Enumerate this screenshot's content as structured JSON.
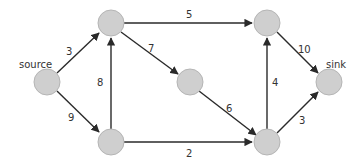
{
  "diagram": {
    "type": "flow-network",
    "nodes": [
      {
        "id": "source",
        "label": "source",
        "x": 47,
        "y": 82
      },
      {
        "id": "a",
        "label": "",
        "x": 111,
        "y": 23
      },
      {
        "id": "b",
        "label": "",
        "x": 111,
        "y": 142
      },
      {
        "id": "c",
        "label": "",
        "x": 190,
        "y": 82
      },
      {
        "id": "d",
        "label": "",
        "x": 267,
        "y": 23
      },
      {
        "id": "e",
        "label": "",
        "x": 267,
        "y": 142
      },
      {
        "id": "sink",
        "label": "sink",
        "x": 329,
        "y": 82
      }
    ],
    "edges": [
      {
        "from": "source",
        "to": "a",
        "capacity": "3"
      },
      {
        "from": "source",
        "to": "b",
        "capacity": "9"
      },
      {
        "from": "b",
        "to": "a",
        "capacity": "8"
      },
      {
        "from": "a",
        "to": "d",
        "capacity": "5"
      },
      {
        "from": "a",
        "to": "c",
        "capacity": "7"
      },
      {
        "from": "c",
        "to": "e",
        "capacity": "6"
      },
      {
        "from": "b",
        "to": "e",
        "capacity": "2"
      },
      {
        "from": "e",
        "to": "d",
        "capacity": "4"
      },
      {
        "from": "d",
        "to": "sink",
        "capacity": "10"
      },
      {
        "from": "e",
        "to": "sink",
        "capacity": "3"
      }
    ],
    "colors": {
      "node_fill": "#cfcfcf",
      "node_stroke": "#b5b5b5",
      "edge": "#2a2a2a",
      "text": "#333333"
    }
  }
}
